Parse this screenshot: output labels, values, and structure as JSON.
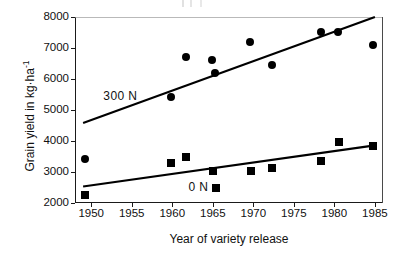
{
  "chart_data": {
    "type": "scatter",
    "title": "",
    "xlabel": "Year of variety release",
    "ylabel": "Grain yield in kg·ha⁻¹",
    "xlim": [
      1948,
      1986
    ],
    "ylim": [
      2000,
      8000
    ],
    "grid": false,
    "legend_position": "inline-annotations",
    "xticks": [
      1950,
      1955,
      1960,
      1965,
      1970,
      1975,
      1980,
      1985
    ],
    "xtick_labels": [
      "1950",
      "1955",
      "1960",
      "1965",
      "1970",
      "1975",
      "1980",
      "1985"
    ],
    "yticks": [
      2000,
      3000,
      4000,
      5000,
      6000,
      7000,
      8000
    ],
    "ytick_labels": [
      "2000",
      "3000",
      "4000",
      "5000",
      "6000",
      "7000",
      "8000"
    ],
    "series": [
      {
        "name": "300 N",
        "marker": "circle",
        "color": "#000000",
        "annotation": "300 N",
        "points": [
          {
            "x": 1949.2,
            "y": 3430
          },
          {
            "x": 1959.8,
            "y": 5420
          },
          {
            "x": 1961.7,
            "y": 6720
          },
          {
            "x": 1964.9,
            "y": 6610
          },
          {
            "x": 1965.3,
            "y": 6200
          },
          {
            "x": 1969.6,
            "y": 7180
          },
          {
            "x": 1972.3,
            "y": 6440
          },
          {
            "x": 1978.3,
            "y": 7520
          },
          {
            "x": 1980.5,
            "y": 7520
          },
          {
            "x": 1984.8,
            "y": 7090
          }
        ],
        "trendline": {
          "x1": 1949.0,
          "y1": 4580,
          "x2": 1985.0,
          "y2": 8000
        }
      },
      {
        "name": "0 N",
        "marker": "square",
        "color": "#000000",
        "annotation": "0 N",
        "points": [
          {
            "x": 1949.2,
            "y": 2250
          },
          {
            "x": 1959.8,
            "y": 3280
          },
          {
            "x": 1961.7,
            "y": 3500
          },
          {
            "x": 1965.0,
            "y": 3040
          },
          {
            "x": 1965.4,
            "y": 2490
          },
          {
            "x": 1969.7,
            "y": 3030
          },
          {
            "x": 1972.3,
            "y": 3140
          },
          {
            "x": 1978.3,
            "y": 3350
          },
          {
            "x": 1980.6,
            "y": 3980
          },
          {
            "x": 1984.8,
            "y": 3850
          }
        ],
        "trendline": {
          "x1": 1949.0,
          "y1": 2530,
          "x2": 1985.0,
          "y2": 3860
        }
      }
    ]
  }
}
